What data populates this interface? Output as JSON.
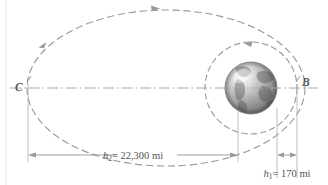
{
  "figure": {
    "background_color": "#ffffff",
    "line_color": "#999999",
    "centerline_color": "#a8a8a8",
    "text_color": "#555555",
    "earth_color_light": "#f2f2f2",
    "earth_color_dark": "#666666"
  },
  "points": {
    "apogee_label": "C",
    "perigee_label": "B"
  },
  "dimensions": {
    "h2": {
      "text": "= 22,300 mi",
      "symbol": "h",
      "subscript": "2",
      "value": "22,300",
      "unit": "mi"
    },
    "h1": {
      "text": "= 170 mi",
      "symbol": "h",
      "subscript": "1",
      "value": "170",
      "unit": "mi"
    }
  },
  "orbits": {
    "transfer_orbit": "transfer-ellipse",
    "circular_orbit": "circular-orbit",
    "direction_arrows": 3
  },
  "body": {
    "name": "earth-sphere"
  }
}
